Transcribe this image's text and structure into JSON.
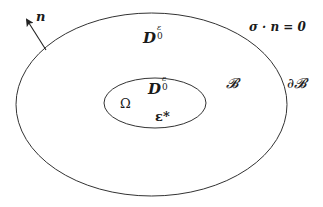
{
  "diagram": {
    "outer_region": {
      "label_main": "D",
      "label_sup": "ε",
      "label_sub": "0",
      "body_label": "𝓑",
      "boundary_label": "∂𝓑",
      "boundary_condition": "σ · n = 0",
      "shape": {
        "cx": 151.5,
        "cy": 104.5,
        "rx": 135.5,
        "ry": 91.5
      }
    },
    "inner_region": {
      "label_main": "D",
      "label_sup": "ε",
      "label_sub": "0",
      "domain_label": "Ω",
      "eigenstrain_label": "ε*",
      "shape": {
        "cx": 155,
        "cy": 103,
        "rx": 51,
        "ry": 25
      }
    },
    "normal_vector": {
      "label": "n",
      "start": {
        "x": 46,
        "y": 50
      },
      "end": {
        "x": 26,
        "y": 19
      }
    },
    "colors": {
      "stroke": "#333333",
      "text": "#1a1a1a",
      "background": "#ffffff"
    }
  }
}
